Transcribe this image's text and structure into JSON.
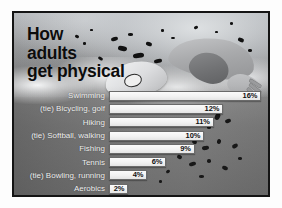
{
  "title": "How\nadults\nget physical",
  "frame": {
    "border_color": "#141414",
    "background_description": "grayscale-swimmer-photo"
  },
  "chart_data": {
    "type": "bar",
    "title": "How adults get physical",
    "xlabel": "",
    "ylabel": "",
    "orientation": "horizontal",
    "grid": false,
    "legend": false,
    "xlim": [
      0,
      16
    ],
    "categories": [
      "Swimming",
      "(tie) Bicycling, golf",
      "Hiking",
      "(tie) Softball, walking",
      "Fishing",
      "Tennis",
      "(tie) Bowling, running",
      "Aerobics"
    ],
    "values": [
      16,
      12,
      11,
      10,
      9,
      6,
      4,
      2
    ],
    "value_labels": [
      "16%",
      "12%",
      "11%",
      "10%",
      "9%",
      "6%",
      "4%",
      "2%"
    ],
    "bar_color": "#f4f4f4",
    "bar_border_color": "#6a6a6a",
    "label_color": "#f4f4f4",
    "value_color": "#111111"
  },
  "rows": [
    {
      "label": "Swimming",
      "value": "16%",
      "pct": 16
    },
    {
      "label": "(tie) Bicycling, golf",
      "value": "12%",
      "pct": 12
    },
    {
      "label": "Hiking",
      "value": "11%",
      "pct": 11
    },
    {
      "label": "(tie) Softball, walking",
      "value": "10%",
      "pct": 10
    },
    {
      "label": "Fishing",
      "value": "9%",
      "pct": 9
    },
    {
      "label": "Tennis",
      "value": "6%",
      "pct": 6
    },
    {
      "label": "(tie) Bowling, running",
      "value": "4%",
      "pct": 4
    },
    {
      "label": "Aerobics",
      "value": "2%",
      "pct": 2
    }
  ]
}
